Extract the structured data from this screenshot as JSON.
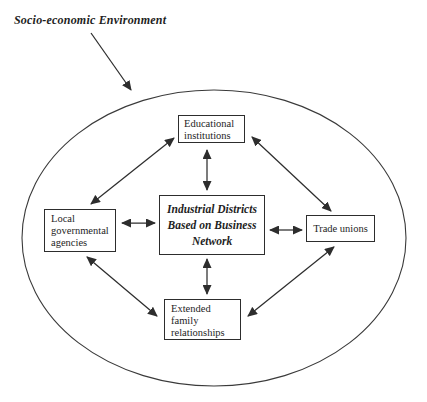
{
  "title": {
    "label": "Socio-economic Environment"
  },
  "nodes": {
    "educational": {
      "name": "Educational institutions",
      "lines": [
        "Educational",
        "institutions"
      ]
    },
    "industrial": {
      "name": "Industrial Districts Based on Business Network",
      "lines": [
        "Industrial Districts",
        "Based on Business",
        "Network"
      ]
    },
    "local": {
      "name": "Local governmental agencies",
      "lines": [
        "Local",
        "governmental",
        "agencies"
      ]
    },
    "trade": {
      "name": "Trade unions",
      "lines": [
        "Trade unions"
      ]
    },
    "extended": {
      "name": "Extended family relationships",
      "lines": [
        "Extended",
        "family",
        "relationships"
      ]
    }
  },
  "connections": [
    {
      "from": "Socio-economic Environment",
      "to": "environment-ellipse",
      "type": "single-arrow"
    },
    {
      "from": "Educational institutions",
      "to": "Local governmental agencies",
      "type": "double-arrow"
    },
    {
      "from": "Educational institutions",
      "to": "Industrial Districts Based on Business Network",
      "type": "double-arrow"
    },
    {
      "from": "Educational institutions",
      "to": "Trade unions",
      "type": "double-arrow"
    },
    {
      "from": "Local governmental agencies",
      "to": "Industrial Districts Based on Business Network",
      "type": "double-arrow"
    },
    {
      "from": "Industrial Districts Based on Business Network",
      "to": "Trade unions",
      "type": "double-arrow"
    },
    {
      "from": "Industrial Districts Based on Business Network",
      "to": "Extended family relationships",
      "type": "double-arrow"
    },
    {
      "from": "Local governmental agencies",
      "to": "Extended family relationships",
      "type": "double-arrow"
    },
    {
      "from": "Extended family relationships",
      "to": "Trade unions",
      "type": "double-arrow"
    }
  ],
  "colors": {
    "ink": "#1e1e1e",
    "line": "#2d2d2d",
    "background": "#ffffff"
  }
}
